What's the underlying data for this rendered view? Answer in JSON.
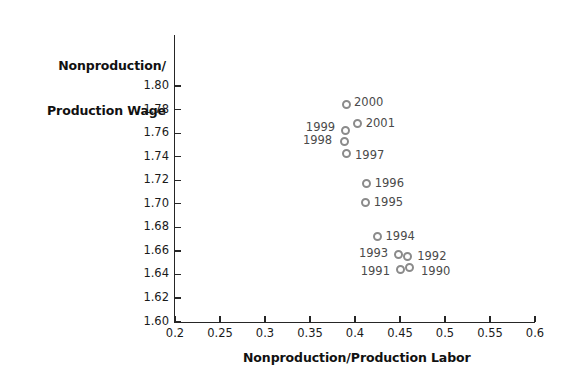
{
  "chart_data": {
    "type": "scatter",
    "title": "",
    "xlabel": "Nonproduction/Production Labor",
    "ylabel": "Nonproduction/\nProduction Wage",
    "ylabel_line1": "Nonproduction/",
    "ylabel_line2": "Production Wage",
    "xlim": [
      0.2,
      0.6
    ],
    "ylim": [
      1.6,
      1.8
    ],
    "xticks": [
      "0.2",
      "0.25",
      "0.3",
      "0.35",
      "0.4",
      "0.45",
      "0.5",
      "0.55",
      "0.6"
    ],
    "xtick_values": [
      0.2,
      0.25,
      0.3,
      0.35,
      0.4,
      0.45,
      0.5,
      0.55,
      0.6
    ],
    "yticks": [
      "1.80",
      "1.78",
      "1.76",
      "1.74",
      "1.72",
      "1.70",
      "1.68",
      "1.66",
      "1.64",
      "1.62",
      "1.60"
    ],
    "ytick_values": [
      1.8,
      1.78,
      1.76,
      1.74,
      1.72,
      1.7,
      1.68,
      1.66,
      1.64,
      1.62,
      1.6
    ],
    "grid": false,
    "legend": "none",
    "marker_color": "#8b8b8b",
    "marker_style": "open-circle",
    "points": [
      {
        "label": "2000",
        "x": 0.39,
        "y": 1.784,
        "label_side": "right"
      },
      {
        "label": "2001",
        "x": 0.403,
        "y": 1.768,
        "label_side": "right"
      },
      {
        "label": "1999",
        "x": 0.389,
        "y": 1.762,
        "label_side": "left"
      },
      {
        "label": "1998",
        "x": 0.388,
        "y": 1.753,
        "label_side": "left"
      },
      {
        "label": "1997",
        "x": 0.39,
        "y": 1.743,
        "label_side": "right"
      },
      {
        "label": "1996",
        "x": 0.413,
        "y": 1.717,
        "label_side": "right"
      },
      {
        "label": "1995",
        "x": 0.412,
        "y": 1.701,
        "label_side": "right"
      },
      {
        "label": "1994",
        "x": 0.425,
        "y": 1.672,
        "label_side": "right"
      },
      {
        "label": "1993",
        "x": 0.448,
        "y": 1.657,
        "label_side": "left"
      },
      {
        "label": "1992",
        "x": 0.458,
        "y": 1.655,
        "label_side": "right"
      },
      {
        "label": "1991",
        "x": 0.45,
        "y": 1.644,
        "label_side": "left"
      },
      {
        "label": "1990",
        "x": 0.46,
        "y": 1.646,
        "label_side": "right"
      }
    ]
  }
}
